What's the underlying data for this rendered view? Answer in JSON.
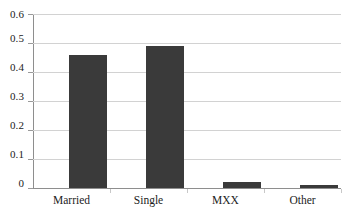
{
  "chart_data": {
    "type": "bar",
    "title": "",
    "subtitle": "",
    "xlabel": "",
    "ylabel": "",
    "categories": [
      "Married",
      "Single",
      "MXX",
      "Other"
    ],
    "values": [
      0.46,
      0.49,
      0.022,
      0.011
    ],
    "series": [
      {
        "name": "",
        "values": [
          0.46,
          0.49,
          0.022,
          0.011
        ]
      }
    ],
    "ylim": [
      0,
      0.6
    ],
    "ytick_labels": [
      "0",
      "0.1",
      "0.2",
      "0.3",
      "0.4",
      "0.5",
      "0.6"
    ],
    "ytick_values": [
      0,
      0.1,
      0.2,
      0.3,
      0.4,
      0.5,
      0.6
    ],
    "grid": true,
    "grid_axis": "y",
    "legend": false,
    "legend_position": "none",
    "annotations": [],
    "colors": {
      "bar": "#3a3a3a",
      "gridline": "#d2d2d2",
      "axis": "#8e8e8e",
      "text": "#1c1c1c",
      "background": "#ffffff"
    }
  }
}
